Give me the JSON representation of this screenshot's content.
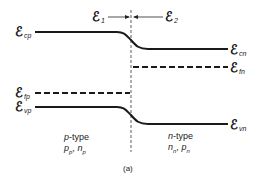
{
  "diagram": {
    "symbol": "ℰ",
    "top_labels": {
      "e1": {
        "sub": "1"
      },
      "e2": {
        "sub": "2"
      }
    },
    "left_labels": {
      "cp": {
        "sub": "cp"
      },
      "fp": {
        "sub": "fp"
      },
      "vp": {
        "sub": "vp"
      }
    },
    "right_labels": {
      "cn": {
        "sub": "cn"
      },
      "fn": {
        "sub": "fn"
      },
      "vn": {
        "sub": "vn"
      }
    },
    "p_region": {
      "type_prefix": "p",
      "type_suffix": "-type",
      "carriers": "p",
      "c1_sub": "p",
      "sep": ", ",
      "c2": "n",
      "c2_sub": "p"
    },
    "n_region": {
      "type_prefix": "n",
      "type_suffix": "-type",
      "carriers": "n",
      "c1_sub": "n",
      "sep": ", ",
      "c2": "p",
      "c2_sub": "n"
    },
    "caption": "(a)",
    "colors": {
      "line": "#1a1a1a",
      "background": "#ffffff"
    }
  }
}
